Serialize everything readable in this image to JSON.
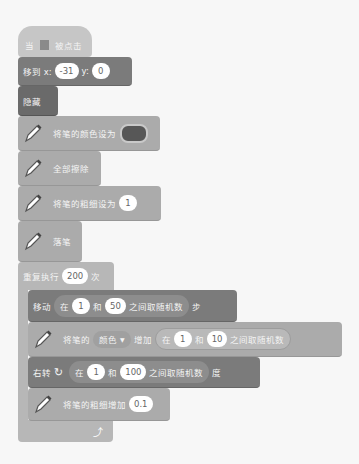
{
  "hat": {
    "prefix": "当",
    "flag_icon": "green-flag-icon",
    "suffix": "被点击"
  },
  "goto": {
    "label_x": "移到 x:",
    "x": "-31",
    "label_y": "y:",
    "y": "0"
  },
  "hide": {
    "label": "隐藏"
  },
  "set_pen_color": {
    "label": "将笔的颜色设为",
    "color": "#575757"
  },
  "clear": {
    "label": "全部擦除"
  },
  "set_pen_size": {
    "label": "将笔的粗细设为",
    "value": "1"
  },
  "pen_down": {
    "label": "落笔"
  },
  "repeat": {
    "label": "重复执行",
    "count": "200",
    "suffix": "次",
    "loop_icon": "loop-arrow-icon"
  },
  "move": {
    "label": "移动",
    "r_in": "在",
    "min": "1",
    "r_and": "和",
    "max": "50",
    "r_tail": "之间取随机数",
    "suffix": "步"
  },
  "change_pen": {
    "label": "将笔的",
    "param": "颜色",
    "verb": "增加",
    "r_in": "在",
    "min": "1",
    "r_and": "和",
    "max": "10",
    "r_tail": "之间取随机数"
  },
  "turn": {
    "label": "右转",
    "icon": "rotate-right-icon",
    "r_in": "在",
    "min": "1",
    "r_and": "和",
    "max": "100",
    "r_tail": "之间取随机数",
    "suffix": "度"
  },
  "change_size": {
    "label": "将笔的粗细增加",
    "value": "0.1"
  }
}
